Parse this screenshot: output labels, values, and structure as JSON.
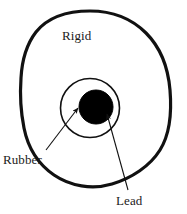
{
  "figure": {
    "background_color": "#ffffff",
    "width": 187,
    "height": 214
  },
  "labels": {
    "rigid": "Rigid",
    "rubber": "Rubber",
    "lead": "Lead"
  },
  "shapes": {
    "rigid": {
      "name": "rigid-outer-boundary",
      "kind": "closed-blob-outline",
      "stroke_color": "#111111",
      "stroke_width": 3.2,
      "fill": "none",
      "path": "M 90 11 C 112 11 132 19 146 33 C 160 47 168 66 170 90 C 172 114 170 134 160 150 C 150 166 132 178 112 184 C 92 190 70 186 54 175 C 38 164 28 148 24 128 C 20 108 20 92 21 78 C 22 60 26 45 36 32 C 48 17 68 11 90 11 Z"
    },
    "rubber": {
      "name": "rubber-ring",
      "kind": "circle",
      "cx": 90,
      "cy": 108,
      "r": 29.5,
      "stroke_color": "#111111",
      "stroke_width": 1.6,
      "fill": "#ffffff"
    },
    "lead": {
      "name": "lead-core",
      "kind": "circle",
      "cx": 96,
      "cy": 107,
      "r": 17,
      "stroke_color": "#000000",
      "stroke_width": 1,
      "fill": "#000000"
    }
  },
  "leaders": [
    {
      "name": "rubber-leader-line",
      "from_x": 46,
      "from_y": 150,
      "to_x": 78,
      "to_y": 108,
      "stroke_color": "#111111",
      "stroke_width": 1.1,
      "arrowhead": "filled-triangle"
    },
    {
      "name": "lead-leader-line",
      "from_x": 128,
      "from_y": 190,
      "to_x": 107,
      "to_y": 114,
      "stroke_color": "#111111",
      "stroke_width": 1.1,
      "arrowhead": "filled-triangle"
    }
  ]
}
